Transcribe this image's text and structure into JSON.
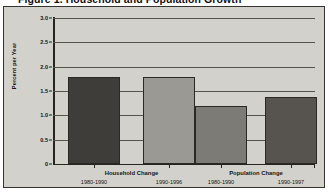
{
  "chart_data": {
    "type": "bar",
    "title": "Figure 1. Household and Population Growth",
    "xlabel": "",
    "ylabel": "Percent per Year",
    "ylim": [
      0,
      3.0
    ],
    "ytick_labels": [
      "0",
      "0.5",
      "1.0",
      "1.5",
      "2.0",
      "2.5",
      "3.0"
    ],
    "ytick_values": [
      0,
      0.5,
      1.0,
      1.5,
      2.0,
      2.5,
      3.0
    ],
    "grid": true,
    "legend": "none",
    "groups": [
      {
        "label": "Household Change"
      },
      {
        "label": "Population Change"
      }
    ],
    "categories": [
      "1980-1990",
      "1990-1996",
      "1980-1990",
      "1990-1997"
    ],
    "values": [
      1.79,
      1.79,
      1.19,
      1.38
    ],
    "bars": [
      {
        "group": "Household Change",
        "period": "1980-1990",
        "value": 1.79,
        "color": "#3f3d3a"
      },
      {
        "group": "Household Change",
        "period": "1990-1996",
        "value": 1.79,
        "color": "#9b9994"
      },
      {
        "group": "Population Change",
        "period": "1980-1990",
        "value": 1.19,
        "color": "#7d7b76"
      },
      {
        "group": "Population Change",
        "period": "1990-1997",
        "value": 1.38,
        "color": "#57544f"
      }
    ]
  },
  "colors": {
    "panel_background": "#d3d1cc",
    "frame": "#35332f",
    "gridline": "#55534e",
    "axis": "#26241f",
    "text": "#16150f"
  }
}
